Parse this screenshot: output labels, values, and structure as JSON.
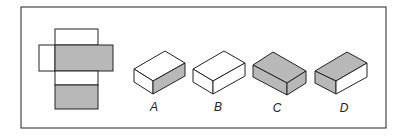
{
  "figure": {
    "colors": {
      "shade": "#b8b8b8",
      "stroke": "#222222",
      "white": "#ffffff"
    },
    "options": [
      {
        "label": "A",
        "top": "white",
        "left": "white",
        "right": "gray"
      },
      {
        "label": "B",
        "top": "white",
        "left": "white",
        "right": "white"
      },
      {
        "label": "C",
        "top": "gray",
        "left": "gray",
        "right": "gray"
      },
      {
        "label": "D",
        "top": "gray",
        "left": "gray",
        "right": "white"
      }
    ]
  }
}
